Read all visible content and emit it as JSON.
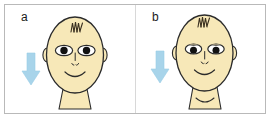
{
  "figure": {
    "background_color": "#ffffff",
    "frame_border_color": "#b9b9b9",
    "divider_color": "#d8d8d8"
  },
  "palette": {
    "skin_fill": "#f7e8b8",
    "skin_fill_light": "#faf0cf",
    "outline": "#2b2b2b",
    "hair_stroke": "#3a3020",
    "pupil": "#111111",
    "eye_white": "#ffffff",
    "arrow_blue": "#a8d4ea",
    "arrow_blue_dark": "#8cc4e2",
    "label_text": "#1a1a1a"
  },
  "panels": [
    {
      "id": "a",
      "label": "a",
      "arrow": {
        "name": "down-arrow",
        "direction": "down",
        "color": "#a8d4ea"
      },
      "face": {
        "hair": "zigzag-tuft",
        "eyes": "wide-open",
        "left_eye": "open",
        "right_eye": "open",
        "nose": "small-vertical-line-with-nostrils",
        "mouth": "smile",
        "ears": "two",
        "neck": "plain"
      }
    },
    {
      "id": "b",
      "label": "b",
      "arrow": {
        "name": "down-arrow",
        "direction": "down",
        "color": "#a8d4ea"
      },
      "face": {
        "hair": "zigzag-tuft",
        "eyes": "drooping-eyelids",
        "left_eye": "ptosis",
        "right_eye": "ptosis",
        "nose": "small-vertical-line-with-nostrils",
        "mouth": "smile",
        "ears": "two",
        "neck": "with-crease-curve"
      }
    }
  ]
}
